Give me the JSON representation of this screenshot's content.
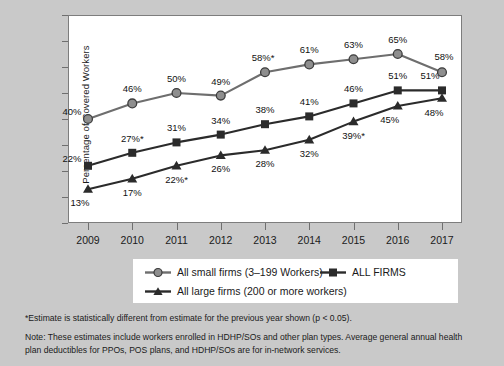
{
  "chart_data": {
    "type": "line",
    "title": "",
    "xlabel": "",
    "ylabel": "Percentage of Covered Workers",
    "categories": [
      "2009",
      "2010",
      "2011",
      "2012",
      "2013",
      "2014",
      "2015",
      "2016",
      "2017"
    ],
    "ylim": [
      0,
      80
    ],
    "ytick_values": [
      0,
      10,
      20,
      30,
      40,
      50,
      60,
      70,
      80
    ],
    "ytick_labels": [
      "0%",
      "10%",
      "20%",
      "30%",
      "40%",
      "50%",
      "60%",
      "70%",
      "80%"
    ],
    "grid": false,
    "legend_position": "below-plot",
    "series": [
      {
        "name": "All small firms (3–199 Workers)",
        "marker": "circle",
        "color": "#6e6e6e",
        "values": [
          40,
          46,
          50,
          49,
          58,
          61,
          63,
          65,
          58
        ],
        "labels": [
          "40%",
          "46%",
          "50%",
          "49%",
          "58%*",
          "61%",
          "63%",
          "65%",
          "58%"
        ],
        "significant": [
          false,
          false,
          false,
          false,
          true,
          false,
          false,
          false,
          false
        ]
      },
      {
        "name": "ALL FIRMS",
        "marker": "square",
        "color": "#2b2b2b",
        "values": [
          22,
          27,
          31,
          34,
          38,
          41,
          46,
          51,
          51
        ],
        "labels": [
          "22%",
          "27%*",
          "31%",
          "34%",
          "38%",
          "41%",
          "46%",
          "51%",
          "51%"
        ],
        "significant": [
          false,
          true,
          false,
          false,
          false,
          false,
          false,
          false,
          false
        ]
      },
      {
        "name": "All large firms (200 or more workers)",
        "marker": "triangle",
        "color": "#2b2b2b",
        "values": [
          13,
          17,
          22,
          26,
          28,
          32,
          39,
          45,
          48
        ],
        "labels": [
          "13%",
          "17%",
          "22%*",
          "26%",
          "28%",
          "32%",
          "39%*",
          "45%",
          "48%"
        ],
        "significant": [
          false,
          false,
          true,
          false,
          false,
          false,
          true,
          false,
          false
        ]
      }
    ],
    "annotations": [
      "*Estimate is statistically different from estimate for the previous year shown (p < 0.05).",
      "Note: These estimates include workers enrolled in HDHP/SOs and other plan types. Average general annual health plan deductibles for PPOs, POS plans, and HDHP/SOs are for in-network services."
    ]
  },
  "axis": {
    "y_title": "Percentage of Covered Workers"
  },
  "legend": {
    "small_label": "All small firms (3–199 Workers)",
    "all_label": "ALL FIRMS",
    "large_label": "All large firms (200 or more workers)"
  },
  "footnotes": {
    "star": "*Estimate is statistically different from estimate for the previous year shown (p < 0.05).",
    "note": "Note: These estimates include workers enrolled in HDHP/SOs and other plan types. Average general annual health plan deductibles for PPOs, POS plans, and HDHP/SOs are for in-network services."
  },
  "colors": {
    "background": "#c9c9c9",
    "plot_background": "#ffffff",
    "small_firms": "#6e6e6e",
    "all_firms": "#2b2b2b",
    "large_firms": "#2b2b2b"
  }
}
